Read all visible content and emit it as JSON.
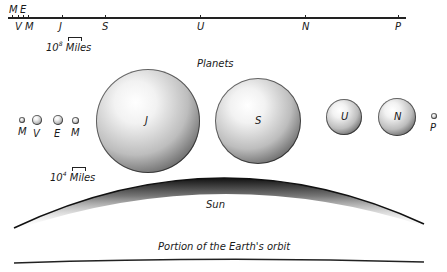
{
  "distance_scale": {
    "labels_above": [
      {
        "text": "M",
        "x": 12
      },
      {
        "text": "E",
        "x": 23
      }
    ],
    "labels_below": [
      {
        "text": "V",
        "x": 18
      },
      {
        "text": "M",
        "x": 28
      },
      {
        "text": "J",
        "x": 62
      },
      {
        "text": "S",
        "x": 105
      },
      {
        "text": "U",
        "x": 200
      },
      {
        "text": "N",
        "x": 305
      },
      {
        "text": "P",
        "x": 398
      }
    ],
    "unit_base": "10",
    "unit_exp": "8",
    "unit_label": "Miles"
  },
  "planets_title": "Planets",
  "planets": [
    {
      "label": "M",
      "name": "Mercury",
      "cx": 22,
      "cy": 120,
      "r": 3
    },
    {
      "label": "V",
      "name": "Venus",
      "cx": 37,
      "cy": 120,
      "r": 5
    },
    {
      "label": "E",
      "name": "Earth",
      "cx": 58,
      "cy": 120,
      "r": 5
    },
    {
      "label": "M",
      "name": "Mars",
      "cx": 75,
      "cy": 120,
      "r": 3.5
    },
    {
      "label": "J",
      "name": "Jupiter",
      "cx": 148,
      "cy": 121,
      "r": 52
    },
    {
      "label": "S",
      "name": "Saturn",
      "cx": 258,
      "cy": 121,
      "r": 43
    },
    {
      "label": "U",
      "name": "Uranus",
      "cx": 344,
      "cy": 117,
      "r": 18
    },
    {
      "label": "N",
      "name": "Neptune",
      "cx": 397,
      "cy": 117,
      "r": 19
    },
    {
      "label": "P",
      "name": "Pluto",
      "cx": 434,
      "cy": 116,
      "r": 3
    }
  ],
  "size_scale": {
    "unit_base": "10",
    "unit_exp": "4",
    "unit_label": "Miles"
  },
  "sun_label": "Sun",
  "orbit_label": "Portion of the Earth's orbit"
}
